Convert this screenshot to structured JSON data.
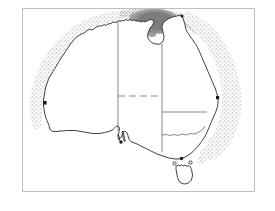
{
  "figure": {
    "kind": "map",
    "region": "Australia",
    "background_color": "#ffffff",
    "frame": {
      "visible": true,
      "color": "#bfbfbf",
      "x": 22,
      "y": 8,
      "width": 233,
      "height": 184
    }
  },
  "legend_colors": {
    "coastline": "#2b2b2b",
    "state_border": "#555555",
    "stipple_light": "#b9b9b9",
    "stipple_mid": "#9a9a9a",
    "dense_blob": "#8a8a8a",
    "dense_blob_dark": "#6e6e6e",
    "land_fill": "#ffffff"
  },
  "map_layers": [
    {
      "name": "coastline",
      "label": "Australian mainland coastline",
      "style": "solid black outline",
      "interactable": false
    },
    {
      "name": "state-borders",
      "label": "State and territory borders",
      "style": "thin grey lines, partly dashed",
      "interactable": false
    },
    {
      "name": "distribution-band-northwest",
      "label": "Stippled distribution band - north-west coast",
      "style": "light grey stipple",
      "interactable": false
    },
    {
      "name": "distribution-band-east",
      "label": "Stippled distribution band - east coast",
      "style": "light grey stipple",
      "interactable": false
    },
    {
      "name": "dense-patch-arnhem",
      "label": "Dense occurrence patch - Arnhem Land / Gulf of Carpentaria",
      "style": "dark grey solid patch",
      "interactable": false
    },
    {
      "name": "dense-patch-pilbara",
      "label": "Dense occurrence patch - Pilbara / Kimberley coast",
      "style": "dark grey solid patch",
      "interactable": false
    }
  ],
  "islands": [
    {
      "name": "tasmania",
      "label": "Tasmania"
    }
  ],
  "point_records": [
    {
      "name": "record-southwest-cape",
      "label": "Coastal record - south-west cape"
    },
    {
      "name": "record-east-coast",
      "label": "Coastal record - central east coast"
    },
    {
      "name": "record-gulf-st-vincent",
      "label": "Coastal record - Gulf St Vincent"
    },
    {
      "name": "record-bass-strait",
      "label": "Coastal record - Bass Strait"
    }
  ],
  "annotations": {
    "title": "",
    "caption": "",
    "scale_bar": "",
    "north_arrow": ""
  }
}
